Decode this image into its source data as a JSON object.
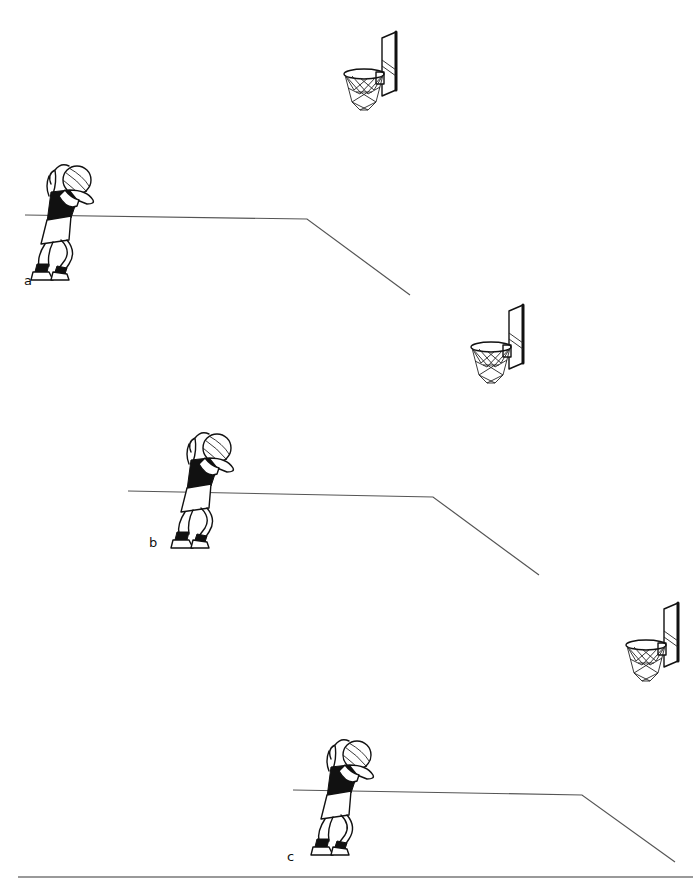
{
  "figure": {
    "panels": [
      {
        "label": "a",
        "label_pos": [
          24,
          283
        ],
        "player_pos": [
          25,
          160
        ],
        "basket_pos": [
          340,
          32
        ],
        "court_line": [
          [
            25,
            215
          ],
          [
            307,
            219
          ],
          [
            410,
            295
          ]
        ]
      },
      {
        "label": "b",
        "label_pos": [
          149,
          543
        ],
        "player_pos": [
          165,
          428
        ],
        "basket_pos": [
          467,
          305
        ],
        "court_line": [
          [
            128,
            491
          ],
          [
            433,
            497
          ],
          [
            539,
            575
          ]
        ]
      },
      {
        "label": "c",
        "label_pos": [
          287,
          858
        ],
        "player_pos": [
          305,
          712
        ],
        "basket_pos": [
          622,
          603
        ],
        "court_line": [
          [
            293,
            790
          ],
          [
            582,
            795
          ],
          [
            675,
            862
          ]
        ]
      }
    ],
    "bottom_rule": {
      "y": 877,
      "x1": 18,
      "x2": 693
    },
    "colors": {
      "ink": "#111111",
      "court_line": "#555555",
      "background": "#ffffff"
    }
  }
}
